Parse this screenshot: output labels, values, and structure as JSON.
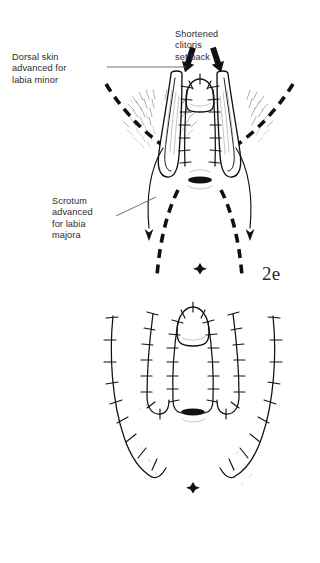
{
  "document": {
    "type": "medical-surgical-illustration",
    "background_color": "#ffffff",
    "ink_color": "#111111"
  },
  "figures": [
    {
      "id": "2e",
      "number_label": "2e",
      "annotations": [
        {
          "name": "dorsal-skin",
          "text": "Dorsal skin\nadvanced for\nlabia minor",
          "lines": [
            "Dorsal skin",
            "advanced for",
            "labia minor"
          ],
          "has_leader_line": true
        },
        {
          "name": "shortened-clitoris",
          "text": "Shortened\nclitoris\nset back",
          "lines": [
            "Shortened",
            "clitoris",
            "set back"
          ],
          "has_leader_line": false,
          "arrow_count": 2
        },
        {
          "name": "scrotum-advanced",
          "text": "Scrotum\nadvanced\nfor labia\nmajora",
          "lines": [
            "Scrotum",
            "advanced",
            "for labia",
            "majora"
          ],
          "has_leader_line": true
        }
      ],
      "anatomy_parts": [
        "clitoris-dome",
        "labia-minora-flap-left",
        "labia-minora-flap-right",
        "vaginal-introitus",
        "anus-marker",
        "scrotal-skin-dashed-left",
        "scrotal-skin-dashed-right",
        "hair-bearing-skin-left",
        "hair-bearing-skin-right"
      ]
    },
    {
      "id": "2f",
      "number_label": "2f",
      "annotations": [
        {
          "name": "completed-closure",
          "text": "Completed\nclosure",
          "lines": [
            "Completed",
            "closure"
          ],
          "has_leader_line": false
        }
      ],
      "anatomy_parts": [
        "clitoral-hood-dome",
        "labia-minora-suture-left",
        "labia-minora-suture-right",
        "labia-majora-suture-left",
        "labia-majora-suture-right",
        "vaginal-introitus",
        "anus-marker"
      ]
    }
  ]
}
